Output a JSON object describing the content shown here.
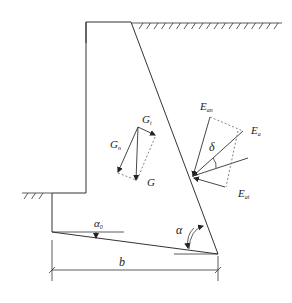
{
  "diagram": {
    "labels": {
      "G": "G",
      "Gt": "G",
      "Gt_sub": "t",
      "Gn": "G",
      "Gn_sub": "n",
      "Ean": "E",
      "Ean_sub": "an",
      "Ea": "E",
      "Ea_sub": "a",
      "Eat": "E",
      "Eat_sub": "at",
      "delta": "δ",
      "alpha": "α",
      "alpha0": "α",
      "alpha0_sub": "0",
      "b": "b"
    },
    "colors": {
      "line": "#333333",
      "dashed": "#777777"
    }
  }
}
